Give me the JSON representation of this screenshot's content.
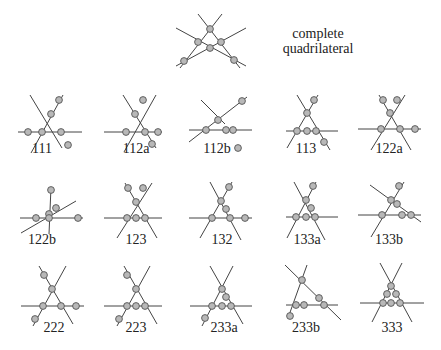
{
  "title": {
    "line1": "complete",
    "line2": "quadrilateral",
    "x": 294,
    "y": 29
  },
  "style": {
    "line_color": "#444444",
    "node_fill": "#b8b8b8",
    "node_stroke": "#555555",
    "node_r": 3.4
  },
  "figures": [
    {
      "name": "complete-quadrilateral",
      "label": "",
      "lines": [
        [
          198,
          14,
          240,
          68
        ],
        [
          222,
          14,
          180,
          68
        ],
        [
          176,
          66,
          246,
          28
        ],
        [
          176,
          28,
          246,
          66
        ]
      ],
      "nodes": [
        [
          210,
          29
        ],
        [
          198,
          42
        ],
        [
          221,
          42
        ],
        [
          210,
          48
        ],
        [
          184,
          61
        ],
        [
          234,
          60
        ]
      ]
    },
    {
      "name": "111",
      "label": "111",
      "lx": 42,
      "ly": 154,
      "lines": [
        [
          30,
          95,
          62,
          148
        ],
        [
          63,
          95,
          31,
          153
        ],
        [
          18,
          132,
          82,
          132
        ]
      ],
      "nodes": [
        [
          51,
          114
        ],
        [
          42,
          132
        ],
        [
          61,
          132
        ],
        [
          59,
          100
        ],
        [
          28,
          132
        ],
        [
          68,
          145
        ]
      ]
    },
    {
      "name": "112a",
      "label": "112a",
      "lx": 136,
      "ly": 154,
      "lines": [
        [
          123,
          95,
          156,
          148
        ],
        [
          156,
          95,
          124,
          152
        ],
        [
          104,
          132,
          162,
          132
        ]
      ],
      "nodes": [
        [
          135,
          114
        ],
        [
          126,
          132
        ],
        [
          145,
          132
        ],
        [
          143,
          100
        ],
        [
          158,
          132
        ],
        [
          152,
          144
        ]
      ]
    },
    {
      "name": "112b",
      "label": "112b",
      "lx": 217,
      "ly": 154,
      "lines": [
        [
          201,
          100,
          225,
          124
        ],
        [
          189,
          142,
          247,
          97
        ],
        [
          189,
          130,
          252,
          130
        ]
      ],
      "nodes": [
        [
          218,
          120
        ],
        [
          206,
          130
        ],
        [
          226,
          130
        ],
        [
          242,
          101
        ],
        [
          233,
          130
        ],
        [
          238,
          148
        ]
      ]
    },
    {
      "name": "113",
      "label": "113",
      "lx": 306,
      "ly": 154,
      "lines": [
        [
          297,
          95,
          330,
          150
        ],
        [
          318,
          95,
          287,
          148
        ],
        [
          286,
          131,
          338,
          131
        ]
      ],
      "nodes": [
        [
          307,
          113
        ],
        [
          297,
          131
        ],
        [
          307,
          131
        ],
        [
          316,
          131
        ],
        [
          314,
          100
        ],
        [
          324,
          142
        ]
      ]
    },
    {
      "name": "122a",
      "label": "122a",
      "lx": 389,
      "ly": 154,
      "lines": [
        [
          379,
          95,
          411,
          150
        ],
        [
          405,
          95,
          371,
          150
        ],
        [
          358,
          129,
          421,
          129
        ]
      ],
      "nodes": [
        [
          390,
          113
        ],
        [
          381,
          129
        ],
        [
          400,
          129
        ],
        [
          383,
          100
        ],
        [
          397,
          100
        ],
        [
          415,
          129
        ]
      ]
    },
    {
      "name": "122b",
      "label": "122b",
      "lx": 42,
      "ly": 245,
      "lines": [
        [
          51,
          187,
          49,
          234
        ],
        [
          21,
          233,
          76,
          201
        ],
        [
          20,
          218,
          83,
          218
        ]
      ],
      "nodes": [
        [
          51,
          190
        ],
        [
          49,
          214
        ],
        [
          56,
          208
        ],
        [
          36,
          218
        ],
        [
          49,
          218
        ],
        [
          78,
          218
        ]
      ]
    },
    {
      "name": "123",
      "label": "123",
      "lx": 136,
      "ly": 245,
      "lines": [
        [
          125,
          183,
          157,
          238
        ],
        [
          152,
          183,
          117,
          238
        ],
        [
          104,
          218,
          162,
          218
        ]
      ],
      "nodes": [
        [
          136,
          202
        ],
        [
          127,
          218
        ],
        [
          136,
          218
        ],
        [
          145,
          218
        ],
        [
          128,
          188
        ],
        [
          143,
          188
        ]
      ]
    },
    {
      "name": "132",
      "label": "132",
      "lx": 222,
      "ly": 245,
      "lines": [
        [
          210,
          182,
          241,
          240
        ],
        [
          232,
          182,
          200,
          238
        ],
        [
          189,
          218,
          252,
          218
        ]
      ],
      "nodes": [
        [
          221,
          201
        ],
        [
          212,
          218
        ],
        [
          230,
          218
        ],
        [
          229,
          187
        ],
        [
          226,
          209
        ],
        [
          245,
          218
        ]
      ]
    },
    {
      "name": "133a",
      "label": "133a",
      "lx": 307,
      "ly": 245,
      "lines": [
        [
          294,
          182,
          325,
          240
        ],
        [
          316,
          182,
          287,
          238
        ],
        [
          286,
          217,
          338,
          217
        ]
      ],
      "nodes": [
        [
          306,
          200
        ],
        [
          296,
          217
        ],
        [
          306,
          217
        ],
        [
          315,
          217
        ],
        [
          313,
          186
        ],
        [
          311,
          208
        ]
      ]
    },
    {
      "name": "133b",
      "label": "133b",
      "lx": 389,
      "ly": 245,
      "lines": [
        [
          370,
          185,
          421,
          222
        ],
        [
          404,
          182,
          371,
          237
        ],
        [
          358,
          215,
          421,
          215
        ]
      ],
      "nodes": [
        [
          391,
          200
        ],
        [
          382,
          215
        ],
        [
          397,
          204
        ],
        [
          402,
          215
        ],
        [
          411,
          215
        ],
        [
          399,
          186
        ]
      ]
    },
    {
      "name": "222",
      "label": "222",
      "lx": 54,
      "ly": 333,
      "lines": [
        [
          39,
          266,
          73,
          324
        ],
        [
          66,
          266,
          33,
          326
        ],
        [
          21,
          306,
          84,
          306
        ]
      ],
      "nodes": [
        [
          52,
          289
        ],
        [
          43,
          306
        ],
        [
          61,
          306
        ],
        [
          44,
          275
        ],
        [
          76,
          306
        ],
        [
          35,
          319
        ]
      ]
    },
    {
      "name": "223",
      "label": "223",
      "lx": 136,
      "ly": 333,
      "lines": [
        [
          124,
          266,
          157,
          324
        ],
        [
          150,
          266,
          117,
          326
        ],
        [
          104,
          306,
          162,
          306
        ]
      ],
      "nodes": [
        [
          136,
          289
        ],
        [
          127,
          306
        ],
        [
          136,
          306
        ],
        [
          145,
          306
        ],
        [
          127,
          275
        ],
        [
          119,
          319
        ]
      ]
    },
    {
      "name": "233a",
      "label": "233a",
      "lx": 224,
      "ly": 333,
      "lines": [
        [
          210,
          266,
          243,
          324
        ],
        [
          233,
          266,
          202,
          326
        ],
        [
          190,
          306,
          252,
          306
        ]
      ],
      "nodes": [
        [
          222,
          289
        ],
        [
          212,
          306
        ],
        [
          222,
          306
        ],
        [
          231,
          306
        ],
        [
          226,
          297
        ],
        [
          205,
          318
        ]
      ]
    },
    {
      "name": "233b",
      "label": "233b",
      "lx": 306,
      "ly": 333,
      "lines": [
        [
          285,
          265,
          341,
          320
        ],
        [
          307,
          265,
          288,
          318
        ],
        [
          286,
          305,
          338,
          305
        ]
      ],
      "nodes": [
        [
          302,
          280
        ],
        [
          296,
          305
        ],
        [
          304,
          305
        ],
        [
          319,
          298
        ],
        [
          324,
          305
        ],
        [
          290,
          316
        ]
      ]
    },
    {
      "name": "333",
      "label": "333",
      "lx": 392,
      "ly": 333,
      "lines": [
        [
          380,
          263,
          412,
          322
        ],
        [
          402,
          263,
          372,
          322
        ],
        [
          360,
          303,
          424,
          303
        ]
      ],
      "nodes": [
        [
          391,
          286
        ],
        [
          387,
          294
        ],
        [
          396,
          294
        ],
        [
          383,
          303
        ],
        [
          391,
          303
        ],
        [
          400,
          303
        ]
      ]
    }
  ]
}
